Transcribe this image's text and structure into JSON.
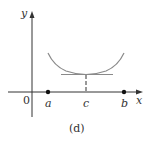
{
  "figure": {
    "caption": "(d)",
    "axes": {
      "x_label": "x",
      "y_label": "y",
      "origin_label": "0"
    },
    "points": [
      {
        "label": "a",
        "filled": true
      },
      {
        "label": "c",
        "tick": true
      },
      {
        "label": "b",
        "filled": true
      }
    ],
    "curve": {
      "description": "U-shaped curve from a to b with horizontal tangent at c",
      "color": "#8a8a8a"
    },
    "tangent_line": {
      "description": "horizontal tangent at c",
      "color": "#8a8a8a"
    },
    "colors": {
      "axis": "#333333",
      "curve": "#8a8a8a",
      "points": "#111111"
    }
  }
}
